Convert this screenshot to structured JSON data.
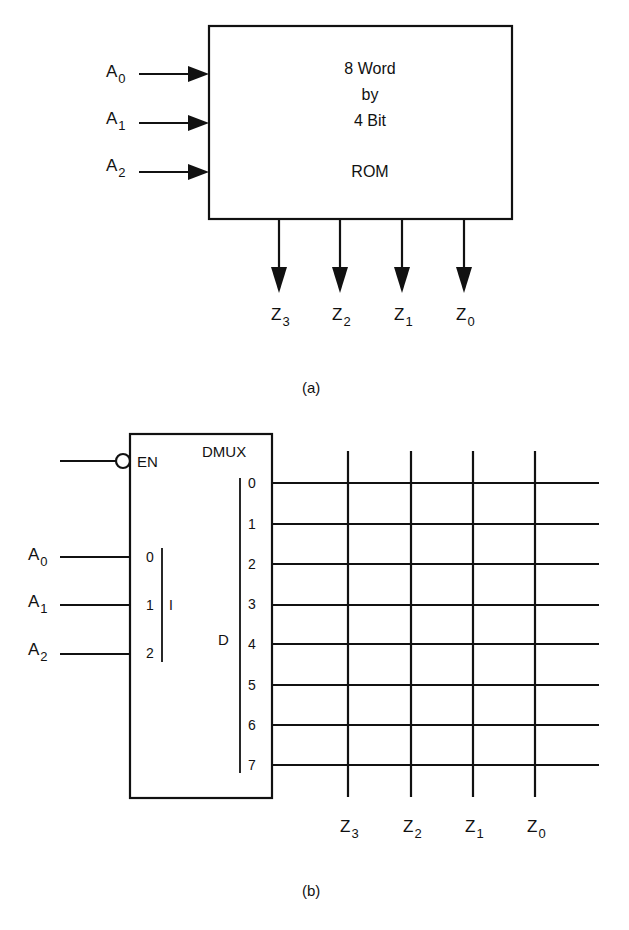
{
  "figure_a": {
    "caption": "(a)",
    "rom_block": {
      "line1": "8 Word",
      "line2": "by",
      "line3": "4 Bit",
      "line4": "ROM"
    },
    "inputs": [
      {
        "name": "A",
        "sub": "0"
      },
      {
        "name": "A",
        "sub": "1"
      },
      {
        "name": "A",
        "sub": "2"
      }
    ],
    "outputs": [
      {
        "name": "Z",
        "sub": "3"
      },
      {
        "name": "Z",
        "sub": "2"
      },
      {
        "name": "Z",
        "sub": "1"
      },
      {
        "name": "Z",
        "sub": "0"
      }
    ]
  },
  "figure_b": {
    "caption": "(b)",
    "dmux_block": {
      "title": "DMUX",
      "enable_label": "EN",
      "input_group_label": "I",
      "output_group_label": "D",
      "input_pins": [
        "0",
        "1",
        "2"
      ],
      "output_pins": [
        "0",
        "1",
        "2",
        "3",
        "4",
        "5",
        "6",
        "7"
      ]
    },
    "inputs": [
      {
        "name": "A",
        "sub": "0"
      },
      {
        "name": "A",
        "sub": "1"
      },
      {
        "name": "A",
        "sub": "2"
      }
    ],
    "outputs": [
      {
        "name": "Z",
        "sub": "3"
      },
      {
        "name": "Z",
        "sub": "2"
      },
      {
        "name": "Z",
        "sub": "1"
      },
      {
        "name": "Z",
        "sub": "0"
      }
    ]
  }
}
